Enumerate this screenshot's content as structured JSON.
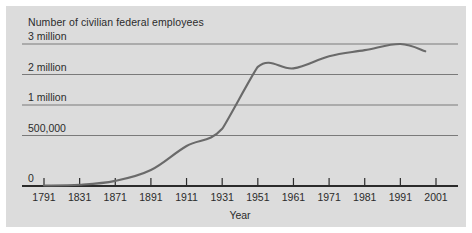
{
  "chart_data": {
    "type": "line",
    "title": "Number of civilian federal employees",
    "xlabel": "Year",
    "ylabel": "",
    "grid": true,
    "legend": false,
    "x_tick_labels": [
      "1791",
      "1831",
      "1871",
      "1891",
      "1911",
      "1931",
      "1951",
      "1961",
      "1971",
      "1981",
      "1991",
      "2001"
    ],
    "x_tick_values": [
      1791,
      1831,
      1871,
      1891,
      1911,
      1931,
      1951,
      1961,
      1971,
      1981,
      1991,
      2001
    ],
    "y_tick_labels": [
      "0",
      "500,000",
      "1 million",
      "2 million",
      "3 million"
    ],
    "y_tick_values": [
      0,
      500000,
      1000000,
      2000000,
      3000000
    ],
    "y_axis_note": "category-spaced axis: ticks equally spaced in pixels though value gaps differ",
    "x_axis_note": "category-spaced axis: ticks equally spaced in pixels though year gaps differ",
    "series": [
      {
        "name": "Civilian federal employees",
        "color": "#6a6a6a",
        "points": [
          {
            "x": 1791,
            "y": 5000
          },
          {
            "x": 1831,
            "y": 12000
          },
          {
            "x": 1871,
            "y": 51000
          },
          {
            "x": 1891,
            "y": 158000
          },
          {
            "x": 1911,
            "y": 396000
          },
          {
            "x": 1931,
            "y": 610000
          },
          {
            "x": 1951,
            "y": 2250000
          },
          {
            "x": 1961,
            "y": 2200000
          },
          {
            "x": 1971,
            "y": 2600000
          },
          {
            "x": 1981,
            "y": 2800000
          },
          {
            "x": 1991,
            "y": 3000000
          },
          {
            "x": 1998,
            "y": 2760000
          }
        ]
      }
    ]
  },
  "colors": {
    "panel_background": "#dcdcdc",
    "gridline": "#7a7a7a",
    "axis": "#2b2b2b",
    "series_line": "#6a6a6a",
    "text": "#2b2b2b"
  }
}
